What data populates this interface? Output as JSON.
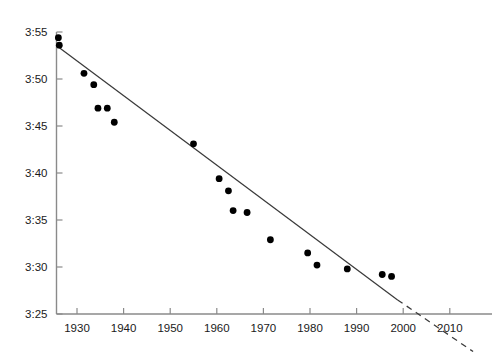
{
  "chart_data": {
    "type": "scatter",
    "title": "",
    "subtitle": "",
    "xlabel": "",
    "ylabel": "",
    "xlim": [
      1925,
      2015
    ],
    "ylim": [
      205,
      235
    ],
    "grid": false,
    "legend": null,
    "y_axis_format": "minutes:seconds (mile time)",
    "x_ticks": [
      1930,
      1940,
      1950,
      1960,
      1970,
      1980,
      1990,
      2000,
      2010
    ],
    "x_tick_labels": [
      "1930",
      "1940",
      "1950",
      "1960",
      "1970",
      "1980",
      "1990",
      "2000",
      "2010"
    ],
    "y_ticks": [
      235,
      230,
      225,
      220,
      215,
      210,
      205
    ],
    "y_tick_labels": [
      "3:55",
      "3:50",
      "3:45",
      "3:40",
      "3:35",
      "3:30",
      "3:25"
    ],
    "series": [
      {
        "name": "World record mile times",
        "type": "scatter",
        "marker": "filled-circle",
        "color": "#000000",
        "points": [
          {
            "x": 1926.0,
            "y": 234.4,
            "label": "3:54.4"
          },
          {
            "x": 1926.2,
            "y": 233.6,
            "label": "3:53.6"
          },
          {
            "x": 1931.5,
            "y": 230.6,
            "label": "3:50.6"
          },
          {
            "x": 1933.6,
            "y": 229.4,
            "label": "3:49.4"
          },
          {
            "x": 1934.5,
            "y": 226.9,
            "label": "3:46.9"
          },
          {
            "x": 1936.5,
            "y": 226.9,
            "label": "3:46.9"
          },
          {
            "x": 1938.0,
            "y": 225.4,
            "label": "3:45.4"
          },
          {
            "x": 1955.0,
            "y": 223.1,
            "label": "3:43.1"
          },
          {
            "x": 1960.5,
            "y": 219.4,
            "label": "3:39.4"
          },
          {
            "x": 1962.5,
            "y": 218.1,
            "label": "3:38.1"
          },
          {
            "x": 1963.5,
            "y": 216.0,
            "label": "3:36.0"
          },
          {
            "x": 1966.5,
            "y": 215.8,
            "label": "3:35.8"
          },
          {
            "x": 1971.5,
            "y": 212.9,
            "label": "3:32.9"
          },
          {
            "x": 1979.5,
            "y": 211.5,
            "label": "3:31.5"
          },
          {
            "x": 1981.5,
            "y": 210.2,
            "label": "3:30.2"
          },
          {
            "x": 1988.0,
            "y": 209.8,
            "label": "3:29.8"
          },
          {
            "x": 1995.5,
            "y": 209.2,
            "label": "3:29.2"
          },
          {
            "x": 1997.5,
            "y": 209.0,
            "label": "3:29.0"
          }
        ]
      },
      {
        "name": "Linear trend (fitted)",
        "type": "line",
        "style": "solid",
        "color": "#3a3a3a",
        "from": {
          "x": 1926.0,
          "y": 233.4
        },
        "to": {
          "x": 1998.8,
          "y": 206.5
        }
      },
      {
        "name": "Linear trend (extrapolated)",
        "type": "line",
        "style": "dashed",
        "color": "#3a3a3a",
        "from": {
          "x": 1998.8,
          "y": 206.5
        },
        "to": {
          "x": 2015.0,
          "y": 201.0
        }
      }
    ]
  },
  "geometry": {
    "axis_x_px": 56.5,
    "axis_y_px": 314.0,
    "plot_right_px": 492.0,
    "plot_top_px": 8.0,
    "x_px_per_decade": 46.6,
    "x_origin_year": 1930,
    "x_origin_px": 77.0,
    "y_px_per_5sec": 47.0,
    "y_origin_value": 205,
    "y_origin_px": 314.0,
    "point_radius_px": 3.4,
    "tick_len_px": 6
  },
  "colors": {
    "background": "#ffffff",
    "axis": "#8a8a8a",
    "marker": "#000000",
    "trend_line": "#3a3a3a",
    "tick_label": "#1a1a1a"
  }
}
